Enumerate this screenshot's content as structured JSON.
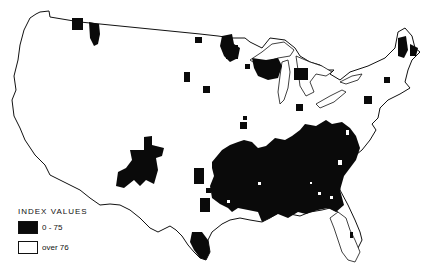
{
  "map": {
    "title": "",
    "region": "Contiguous United States",
    "colors": {
      "low": "#0a0a0a",
      "high": "#ffffff",
      "outline": "#111111"
    }
  },
  "legend": {
    "title": "INDEX VALUES",
    "items": [
      {
        "label": "0 - 75",
        "fill": "black"
      },
      {
        "label": "over 76",
        "fill": "white"
      }
    ]
  }
}
